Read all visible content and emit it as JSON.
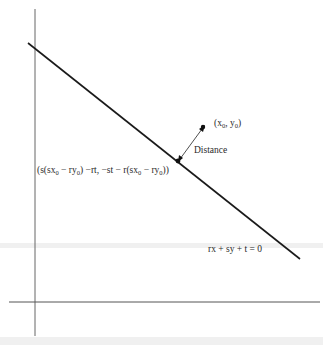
{
  "diagram": {
    "type": "point-to-line-distance",
    "line_equation": "rx + sy + t = 0",
    "point_label": "(x0, y0)",
    "distance_label": "Distance",
    "foot_label": "(s(sx0 − ry0) −rt, −st − r(sx0 − ry0))",
    "colors": {
      "line": "#1a1a1a",
      "axes": "#555555",
      "text": "#2a2a2a",
      "background": "#ffffff"
    }
  },
  "labels": {
    "point": {
      "pre": "(x",
      "sub1": "0",
      "mid": ", y",
      "sub2": "0",
      "post": ")"
    },
    "distance": "Distance",
    "equation": "rx + sy + t = 0",
    "foot": {
      "p1": "(s(sx",
      "s1": "0",
      "p2": " − ry",
      "s2": "0",
      "p3": ") −rt, −st − r(sx",
      "s3": "0",
      "p4": " − ry",
      "s4": "0",
      "p5": "))"
    }
  }
}
